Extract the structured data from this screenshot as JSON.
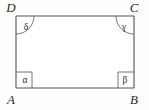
{
  "figure": {
    "type": "geometry-diagram",
    "shape": "rectangle",
    "background_color": "#fdfdfd",
    "interior_color": "#ffffff",
    "stroke_color": "#555555",
    "marker_color": "#666666",
    "text_color": "#2b2b2b",
    "rect": {
      "left": 16,
      "top": 16,
      "right": 134,
      "bottom": 88
    },
    "vertices": [
      {
        "id": "D",
        "label": "D",
        "position": "top-left",
        "label_x": 11,
        "label_y": 12
      },
      {
        "id": "C",
        "label": "C",
        "position": "top-right",
        "label_x": 134,
        "label_y": 12
      },
      {
        "id": "A",
        "label": "A",
        "position": "bottom-left",
        "label_x": 11,
        "label_y": 103
      },
      {
        "id": "B",
        "label": "B",
        "position": "bottom-right",
        "label_x": 134,
        "label_y": 103
      }
    ],
    "angles": [
      {
        "id": "delta",
        "label": "δ",
        "vertex": "D",
        "marker": "arc",
        "label_x": 26,
        "label_y": 30
      },
      {
        "id": "gamma",
        "label": "γ",
        "vertex": "C",
        "marker": "arc",
        "label_x": 124,
        "label_y": 30
      },
      {
        "id": "alpha",
        "label": "α",
        "vertex": "A",
        "marker": "square",
        "label_x": 25,
        "label_y": 83
      },
      {
        "id": "beta",
        "label": "β",
        "vertex": "B",
        "marker": "square",
        "label_x": 125,
        "label_y": 83
      }
    ]
  }
}
